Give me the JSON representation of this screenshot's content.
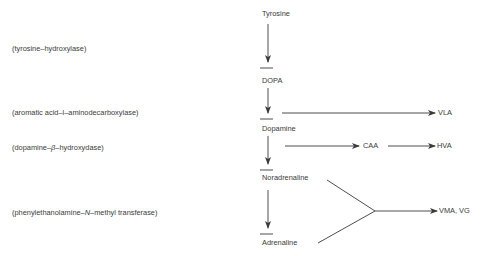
{
  "diagram": {
    "type": "metabolic-pathway",
    "compounds": [
      {
        "id": "tyrosine",
        "label": "Tyrosine"
      },
      {
        "id": "dopa",
        "label": "DOPA"
      },
      {
        "id": "dopamine",
        "label": "Dopamine"
      },
      {
        "id": "noradrenaline",
        "label": "Noradrenaline"
      },
      {
        "id": "adrenaline",
        "label": "Adrenaline"
      }
    ],
    "metabolites": [
      {
        "id": "vla",
        "label": "VLA"
      },
      {
        "id": "caa",
        "label": "CAA"
      },
      {
        "id": "hva",
        "label": "HVA"
      },
      {
        "id": "vma_vg",
        "label": "VMA, VG"
      }
    ],
    "enzymes": [
      {
        "step": "tyrosine-to-dopa",
        "open": "(tyrosine–hydroxylase)"
      },
      {
        "step": "dopa-to-dopamine",
        "open": "(aromatic acid–l–aminodecarboxylase)"
      },
      {
        "step": "dopamine-to-noradrenaline",
        "pre": "(dopamine–",
        "greek": "β",
        "post": "–hydroxydase)"
      },
      {
        "step": "noradrenaline-to-adrenaline",
        "pre": "(phenylethanolamine–",
        "italic": "N",
        "post": "–methyl transferase)"
      }
    ],
    "edges": [
      {
        "from": "Tyrosine",
        "to": "DOPA"
      },
      {
        "from": "DOPA",
        "to": "Dopamine"
      },
      {
        "from": "Dopamine",
        "to": "VLA"
      },
      {
        "from": "Dopamine",
        "to": "CAA"
      },
      {
        "from": "CAA",
        "to": "HVA"
      },
      {
        "from": "Dopamine",
        "to": "Noradrenaline"
      },
      {
        "from": "Noradrenaline",
        "to": "Adrenaline"
      },
      {
        "from": "Noradrenaline",
        "to": "VMA, VG"
      },
      {
        "from": "Adrenaline",
        "to": "VMA, VG"
      }
    ],
    "colors": {
      "line": "#3a3a3a",
      "text": "#3a3a3a",
      "background": "#ffffff"
    }
  }
}
